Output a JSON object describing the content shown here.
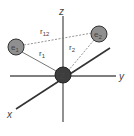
{
  "diagram": {
    "axes": {
      "x_label": "x",
      "y_label": "y",
      "z_label": "z"
    },
    "nucleus": {
      "label": "Z",
      "color": "#3d3d3d"
    },
    "electrons": [
      {
        "label": "e",
        "sub": "1",
        "color": "#8f8f8f"
      },
      {
        "label": "e",
        "sub": "2",
        "color": "#8f8f8f"
      }
    ],
    "distances": [
      {
        "label": "r",
        "sub": "12"
      },
      {
        "label": "r",
        "sub": "1"
      },
      {
        "label": "r",
        "sub": "2"
      }
    ]
  }
}
